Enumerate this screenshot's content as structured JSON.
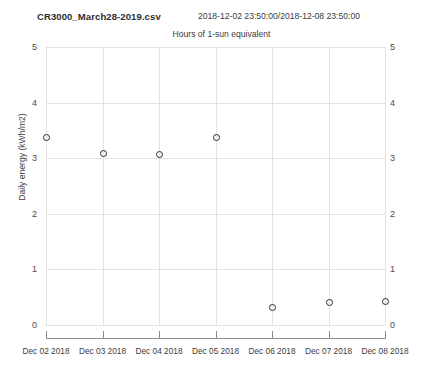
{
  "header": {
    "filename": "CR3000_March28-2019.csv",
    "date_range": "2018-12-02 23:50:00/2018-12-08 23:50:00"
  },
  "chart_data": {
    "type": "scatter",
    "title": "Hours of 1-sun equivalent",
    "subtitle": "Hours of 1-sun equivalent",
    "xlabel": "",
    "ylabel": "Daily energy (kWh/m2)",
    "categories": [
      "Dec 02 2018",
      "Dec 03 2018",
      "Dec 04 2018",
      "Dec 05 2018",
      "Dec 06 2018",
      "Dec 07 2018",
      "Dec 08 2018"
    ],
    "values": [
      3.38,
      3.1,
      3.07,
      3.38,
      0.33,
      0.42,
      0.44
    ],
    "ylim": [
      0,
      5
    ],
    "yticks": [
      0,
      1,
      2,
      3,
      4,
      5
    ],
    "ytick_labels": [
      "0",
      "1",
      "2",
      "3",
      "4",
      "5"
    ],
    "xtick_labels": [
      "Dec 02 2018",
      "Dec 03 2018",
      "Dec 04 2018",
      "Dec 05 2018",
      "Dec 06 2018",
      "Dec 07 2018",
      "Dec 08 2018"
    ],
    "grid": true,
    "legend": null,
    "marker": "open-circle",
    "marker_color": "#2b2b2b",
    "grid_color": "#e2e2e2",
    "axis_color": "#8d8d8d",
    "background": "#ffffff",
    "dual_y_axis": true
  }
}
